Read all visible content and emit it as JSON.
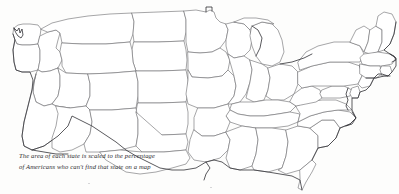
{
  "figure": {
    "kind": "cartogram-map",
    "region": "Contiguous United States",
    "background_color": "#fdfdfc",
    "outline_color": "#6e6e72",
    "coast_color": "#3d3d42"
  },
  "caption": {
    "line1": "The area of each state is scaled to the percentage",
    "line2": "of Americans who can't find that state on a map",
    "full_text": "The area of each state is scaled to the percentage of Americans who can't find that state on a map",
    "style": "italic-serif",
    "color": "#2a2a2e"
  },
  "map": {
    "title": "",
    "projection_note": "state areas distorted by unfamiliarity",
    "states": [
      {
        "name": "Washington",
        "scale": "small"
      },
      {
        "name": "Oregon",
        "scale": "medium"
      },
      {
        "name": "California",
        "scale": "small"
      },
      {
        "name": "Idaho",
        "scale": "large"
      },
      {
        "name": "Nevada",
        "scale": "medium"
      },
      {
        "name": "Montana",
        "scale": "large"
      },
      {
        "name": "Wyoming",
        "scale": "large"
      },
      {
        "name": "Utah",
        "scale": "medium"
      },
      {
        "name": "Arizona",
        "scale": "medium"
      },
      {
        "name": "Colorado",
        "scale": "medium"
      },
      {
        "name": "New Mexico",
        "scale": "medium"
      },
      {
        "name": "North Dakota",
        "scale": "large"
      },
      {
        "name": "South Dakota",
        "scale": "large"
      },
      {
        "name": "Nebraska",
        "scale": "large"
      },
      {
        "name": "Kansas",
        "scale": "large"
      },
      {
        "name": "Oklahoma",
        "scale": "medium"
      },
      {
        "name": "Texas",
        "scale": "small"
      },
      {
        "name": "Minnesota",
        "scale": "medium"
      },
      {
        "name": "Iowa",
        "scale": "medium"
      },
      {
        "name": "Missouri",
        "scale": "medium"
      },
      {
        "name": "Arkansas",
        "scale": "medium"
      },
      {
        "name": "Louisiana",
        "scale": "small"
      },
      {
        "name": "Wisconsin",
        "scale": "medium"
      },
      {
        "name": "Illinois",
        "scale": "medium"
      },
      {
        "name": "Michigan",
        "scale": "medium"
      },
      {
        "name": "Indiana",
        "scale": "medium"
      },
      {
        "name": "Ohio",
        "scale": "medium"
      },
      {
        "name": "Kentucky",
        "scale": "medium"
      },
      {
        "name": "Tennessee",
        "scale": "medium"
      },
      {
        "name": "Mississippi",
        "scale": "medium"
      },
      {
        "name": "Alabama",
        "scale": "medium"
      },
      {
        "name": "Georgia",
        "scale": "medium"
      },
      {
        "name": "Florida",
        "scale": "tiny"
      },
      {
        "name": "South Carolina",
        "scale": "medium"
      },
      {
        "name": "North Carolina",
        "scale": "medium"
      },
      {
        "name": "Virginia",
        "scale": "medium"
      },
      {
        "name": "West Virginia",
        "scale": "medium"
      },
      {
        "name": "Maryland",
        "scale": "small"
      },
      {
        "name": "Delaware",
        "scale": "small"
      },
      {
        "name": "Pennsylvania",
        "scale": "large"
      },
      {
        "name": "New Jersey",
        "scale": "small"
      },
      {
        "name": "New York",
        "scale": "large"
      },
      {
        "name": "Connecticut",
        "scale": "large"
      },
      {
        "name": "Rhode Island",
        "scale": "large"
      },
      {
        "name": "Massachusetts",
        "scale": "large"
      },
      {
        "name": "Vermont",
        "scale": "large"
      },
      {
        "name": "New Hampshire",
        "scale": "large"
      },
      {
        "name": "Maine",
        "scale": "large"
      }
    ]
  }
}
